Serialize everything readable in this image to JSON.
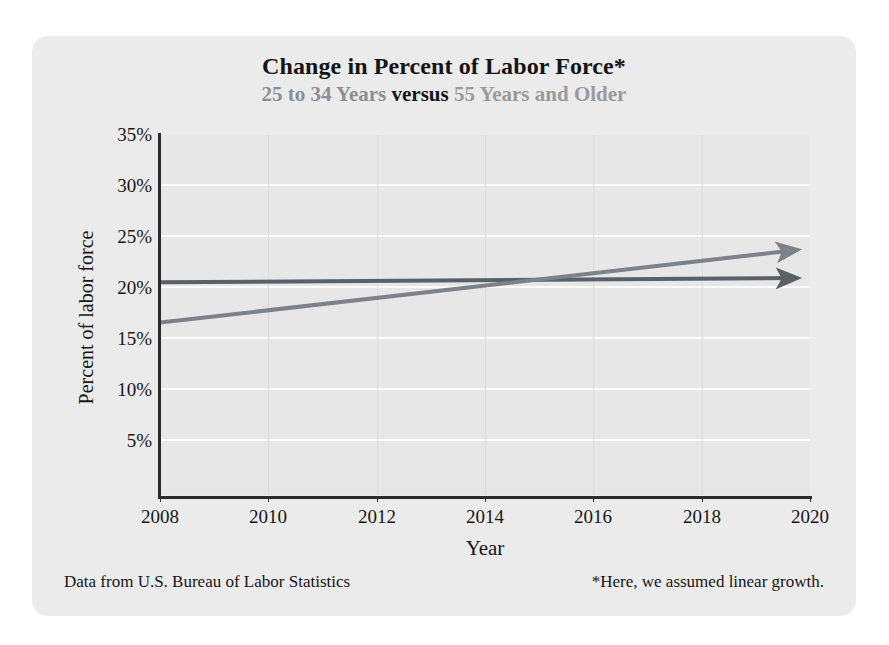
{
  "chart_data": {
    "type": "line",
    "title": "Change in Percent of Labor Force*",
    "subtitle_segments": [
      {
        "text": "25 to 34 Years ",
        "color": "#8a8f95"
      },
      {
        "text": "versus",
        "color": "#141414"
      },
      {
        "text": " 55 Years and Older",
        "color": "#9a9a9a"
      }
    ],
    "subtitle_plain": "25 to 34 Years versus 55 Years and Older",
    "xlabel": "Year",
    "ylabel": "Percent of labor force",
    "xlim": [
      2008,
      2020
    ],
    "ylim": [
      2.5,
      35.5
    ],
    "xticks": [
      2008,
      2010,
      2012,
      2014,
      2016,
      2018,
      2020
    ],
    "xtick_labels": [
      "2008",
      "2010",
      "2012",
      "2014",
      "2016",
      "2018",
      "2020"
    ],
    "yticks": [
      5,
      10,
      15,
      20,
      25,
      30,
      35
    ],
    "ytick_labels": [
      "5%",
      "10%",
      "15%",
      "20%",
      "25%",
      "30%",
      "35%"
    ],
    "grid": "horizontal-white-and-faint-vertical",
    "legend": "none",
    "series": [
      {
        "name": "25 to 34 Years",
        "color": "#5a6068",
        "line_end_marker": "arrow",
        "x": [
          2008,
          2020
        ],
        "values": [
          22.0,
          22.5
        ]
      },
      {
        "name": "55 Years and Older",
        "color": "#7c8288",
        "line_end_marker": "arrow",
        "x": [
          2008,
          2020
        ],
        "values": [
          18.3,
          25.1
        ]
      }
    ],
    "annotations": [
      "Data from U.S. Bureau of Labor Statistics",
      "*Here, we assumed linear growth."
    ]
  },
  "footer": {
    "source": "Data from U.S. Bureau of Labor Statistics",
    "note": "*Here, we assumed linear growth."
  },
  "colors": {
    "panel_background": "#ebebeb",
    "plot_background": "#e7e7e7",
    "axis": "#2b2b2b",
    "gridline": "#fbfbfb",
    "series_flat": "#5a6068",
    "series_rising": "#7c8288"
  }
}
